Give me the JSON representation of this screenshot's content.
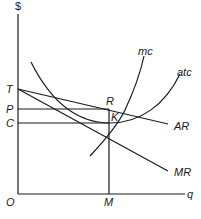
{
  "diagram": {
    "type": "monopoly-cost-revenue-diagram",
    "axes": {
      "y_label": "$",
      "x_label": "q",
      "origin_label": "O"
    },
    "y_axis_labels": [
      "T",
      "P",
      "C"
    ],
    "x_axis_labels": [
      "M"
    ],
    "points": {
      "R": "R",
      "K": "K"
    },
    "curves": {
      "mc": "mc",
      "atc": "atc",
      "AR": "AR",
      "MR": "MR"
    },
    "colors": {
      "line": "#1a1a1a",
      "background": "#ffffff"
    }
  }
}
